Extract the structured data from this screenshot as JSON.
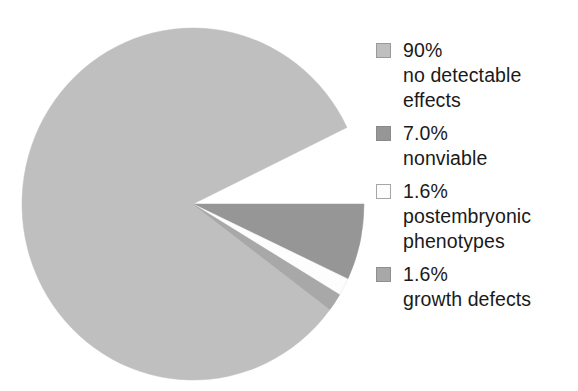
{
  "chart_data": {
    "type": "pie",
    "title": "",
    "subtitle": "",
    "xlabel": "",
    "ylabel": "",
    "legend_position": "right",
    "grid": false,
    "start_angle_deg": 0,
    "direction": "clockwise",
    "categories": [
      "no detectable effects",
      "nonviable",
      "postembryonic phenotypes",
      "growth defects"
    ],
    "values": [
      90,
      7.0,
      1.6,
      1.6
    ],
    "value_labels": [
      "90%",
      "7.0%",
      "1.6%",
      "1.6%"
    ],
    "colors": [
      "#bfbfbf",
      "#969696",
      "#fdfdfd",
      "#a8a8a8"
    ],
    "slices": [
      {
        "label": "no detectable effects",
        "value": 90,
        "value_label": "90%",
        "color": "#bfbfbf",
        "start_deg": 10.2,
        "end_deg": 334.2
      },
      {
        "label": "nonviable",
        "value": 7.0,
        "value_label": "7.0%",
        "color": "#969696",
        "start_deg": 0,
        "end_deg": 25.2
      },
      {
        "label": "postembryonic phenotypes",
        "value": 1.6,
        "value_label": "1.6%",
        "color": "#fdfdfd",
        "start_deg": 25.2,
        "end_deg": 31.0
      },
      {
        "label": "growth defects",
        "value": 1.6,
        "value_label": "1.6%",
        "color": "#a8a8a8",
        "start_deg": 31.0,
        "end_deg": 36.8
      }
    ]
  },
  "legend": {
    "entries": [
      {
        "swatch_color": "#bfbfbf",
        "swatch_border": "#9a9a9a",
        "lines": [
          "90%",
          "no detectable",
          "effects"
        ]
      },
      {
        "swatch_color": "#969696",
        "swatch_border": "#8a8a8a",
        "lines": [
          "7.0%",
          "nonviable"
        ]
      },
      {
        "swatch_color": "#fdfdfd",
        "swatch_border": "#a6a6a6",
        "lines": [
          "1.6%",
          "postembryonic",
          "phenotypes"
        ]
      },
      {
        "swatch_color": "#a8a8a8",
        "swatch_border": "#8f8f8f",
        "lines": [
          "1.6%",
          "growth defects"
        ]
      }
    ]
  }
}
